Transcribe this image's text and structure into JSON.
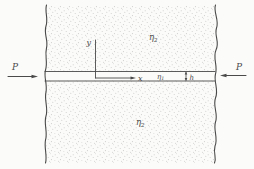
{
  "figure": {
    "colors": {
      "background": "#fbfbf9",
      "ink": "#4a4a4a",
      "stipple": "#c9c9c9"
    },
    "labels": {
      "force_left": "P",
      "force_right": "P",
      "axis_x": "x",
      "axis_y": "y",
      "thickness": "h",
      "eta_layer": {
        "base": "η",
        "sub": "1"
      },
      "eta_top": {
        "base": "η",
        "sub": "2"
      },
      "eta_bottom": {
        "base": "η",
        "sub": "2"
      }
    }
  }
}
